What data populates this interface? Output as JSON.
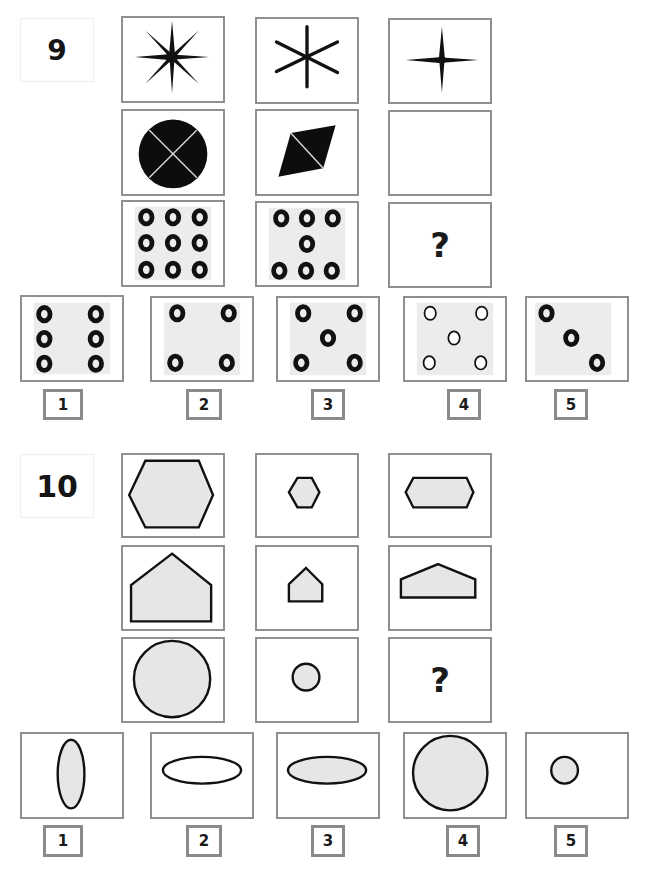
{
  "problems": [
    {
      "number": "9",
      "grid": {
        "row1": [
          "8-point star",
          "6-point star",
          "4-point star"
        ],
        "row2": [
          "black circle divided in 4 by 2 diagonals",
          "black rhombus with 1 diagonal",
          "empty"
        ],
        "row3": [
          "9 rings in 3x3 grid",
          "7 rings (3 top, 1 center, 3 bottom)",
          "?"
        ]
      },
      "question_mark": "?",
      "answers": [
        {
          "label": "1",
          "description": "6 thick rings, 2 columns x 3 rows"
        },
        {
          "label": "2",
          "description": "4 thick rings at corners"
        },
        {
          "label": "3",
          "description": "5 thick rings, corners plus center"
        },
        {
          "label": "4",
          "description": "5 thin rings, corners plus center"
        },
        {
          "label": "5",
          "description": "3 thick rings on a diagonal"
        }
      ]
    },
    {
      "number": "10",
      "grid": {
        "row1": [
          "large hexagon",
          "small hexagon",
          "wide flattened hexagon"
        ],
        "row2": [
          "large pentagon (house)",
          "small pentagon (house)",
          "wide flattened pentagon"
        ],
        "row3": [
          "large circle",
          "small circle",
          "?"
        ]
      },
      "question_mark": "?",
      "answers": [
        {
          "label": "1",
          "description": "tall vertical ellipse, grey fill"
        },
        {
          "label": "2",
          "description": "wide horizontal ellipse, white fill"
        },
        {
          "label": "3",
          "description": "wide horizontal ellipse, grey fill"
        },
        {
          "label": "4",
          "description": "large circle, grey fill"
        },
        {
          "label": "5",
          "description": "small circle, grey fill"
        }
      ]
    }
  ],
  "colors": {
    "border": "#8f8f8f",
    "shape_fill": "#e6e6e6",
    "ink": "#111111",
    "panel": "#ececec"
  }
}
